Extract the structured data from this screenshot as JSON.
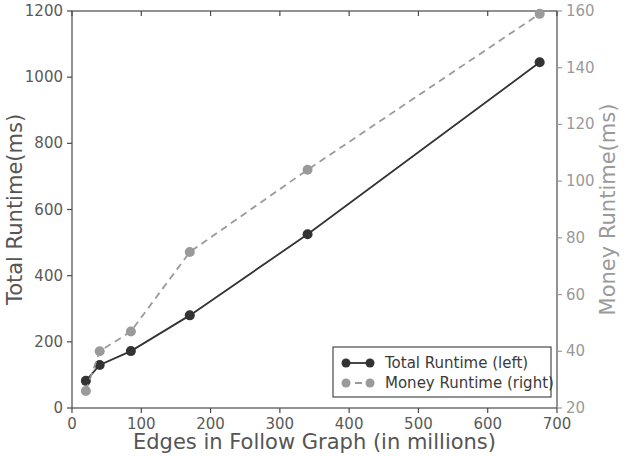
{
  "chart_data": {
    "type": "line",
    "title": "",
    "xlabel": "Edges in Follow Graph (in millions)",
    "ylabel": "Total Runtime(ms)",
    "y2label": "Money Runtime(ms)",
    "xlim": [
      0,
      700
    ],
    "ylim": [
      0,
      1200
    ],
    "y2lim": [
      20,
      160
    ],
    "xticks": [
      0,
      100,
      200,
      300,
      400,
      500,
      600,
      700
    ],
    "yticks": [
      0,
      200,
      400,
      600,
      800,
      1000,
      1200
    ],
    "y2ticks": [
      20,
      40,
      60,
      80,
      100,
      120,
      140,
      160
    ],
    "grid": false,
    "legend_position": "lower right",
    "series": [
      {
        "name": "Total Runtime (left)",
        "axis": "left",
        "color": "#333333",
        "linestyle": "solid",
        "marker": "circle",
        "x": [
          20,
          40,
          85,
          170,
          340,
          675
        ],
        "values": [
          82,
          130,
          172,
          280,
          525,
          1045
        ]
      },
      {
        "name": "Money Runtime (right)",
        "axis": "right",
        "color": "#9a9a9a",
        "linestyle": "dashed",
        "marker": "circle",
        "x": [
          20,
          40,
          85,
          170,
          340,
          675
        ],
        "values": [
          26,
          40,
          47,
          75,
          104,
          159
        ]
      }
    ]
  },
  "legend": {
    "entries": [
      {
        "label": "Total Runtime (left)"
      },
      {
        "label": "Money Runtime (right)"
      }
    ]
  }
}
